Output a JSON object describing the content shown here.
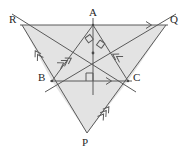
{
  "figure": {
    "background_color": "#ffffff",
    "stroke_color": "#5a5a5a",
    "fill_color": "#e3e3e3",
    "label_color": "#262626"
  },
  "labels": {
    "A": "A",
    "B": "B",
    "C": "C",
    "P": "P",
    "Q": "Q",
    "R": "R"
  },
  "points": {
    "A": {
      "x": 93,
      "y": 25
    },
    "B": {
      "x": 52,
      "y": 81
    },
    "C": {
      "x": 128,
      "y": 81
    },
    "P": {
      "x": 87,
      "y": 133
    },
    "Q": {
      "x": 166,
      "y": 25
    },
    "R": {
      "x": 22,
      "y": 25
    },
    "orthocenter": {
      "x": 93,
      "y": 53
    },
    "foot_on_BC": {
      "x": 93,
      "y": 81
    }
  },
  "label_positions": {
    "A": {
      "x": 89,
      "y": 8
    },
    "B": {
      "x": 38,
      "y": 72
    },
    "C": {
      "x": 133,
      "y": 72
    },
    "P": {
      "x": 82,
      "y": 137
    },
    "Q": {
      "x": 170,
      "y": 14
    },
    "R": {
      "x": 9,
      "y": 14
    }
  },
  "segments": [
    {
      "name": "line-RQ",
      "from": "R",
      "to": "Q"
    },
    {
      "name": "line-BC",
      "from": "B",
      "to": "C"
    },
    {
      "name": "side-AB",
      "from": "A",
      "to": "B"
    },
    {
      "name": "side-AC",
      "from": "A",
      "to": "C"
    },
    {
      "name": "line-RB-P",
      "from": "R",
      "to": "P"
    },
    {
      "name": "line-QC-P",
      "from": "Q",
      "to": "P"
    },
    {
      "name": "cevian-B-to-Q",
      "from": "B",
      "to": "Q"
    },
    {
      "name": "cevian-C-to-R",
      "from": "C",
      "to": "R"
    },
    {
      "name": "altitude-A-to-BC",
      "from": "A",
      "to": "foot_on_BC"
    }
  ],
  "right_angle_marks": [
    {
      "name": "right-angle-left-of-A",
      "x": 85,
      "y": 38
    },
    {
      "name": "right-angle-right-of-A",
      "x": 99,
      "y": 40
    },
    {
      "name": "right-angle-at-foot-BC",
      "x": 88,
      "y": 73
    }
  ],
  "parallel_ticks": [
    {
      "name": "single-arrow-on-RQ",
      "count": 1,
      "x": 150,
      "y": 25,
      "angle": 0
    },
    {
      "name": "single-arrow-on-BC",
      "count": 1,
      "x": 110,
      "y": 81,
      "angle": 0
    },
    {
      "name": "double-arrow-on-RB",
      "count": 2,
      "x": 36,
      "y": 52,
      "angle": 234
    },
    {
      "name": "double-arrow-on-CA-extension",
      "count": 2,
      "x": 114,
      "y": 55,
      "angle": 234
    },
    {
      "name": "triple-arrow-on-BQ",
      "count": 3,
      "x": 68,
      "y": 60,
      "angle": 326
    },
    {
      "name": "triple-arrow-on-PC",
      "count": 3,
      "x": 106,
      "y": 110,
      "angle": 326
    }
  ],
  "shaded_regions": [
    {
      "name": "upper-region-R-Q-C-B",
      "points": "22,25 166,25 128,81 52,81"
    },
    {
      "name": "lower-region-B-C-P",
      "points": "52,81 128,81 87,133"
    }
  ]
}
